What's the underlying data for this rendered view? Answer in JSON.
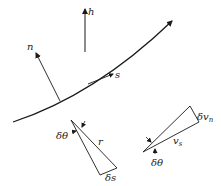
{
  "diagram": {
    "type": "geometry-schematic",
    "colors": {
      "stroke": "#1a1a1a",
      "background": "#ffffff"
    },
    "labels": {
      "h": "h",
      "n": "n",
      "s": "s",
      "triangle1_angle": "δθ",
      "triangle1_radius": "r",
      "triangle1_arc": "δs",
      "triangle2_normal_base": "δv",
      "triangle2_normal_sub": "n",
      "triangle2_side_base": "v",
      "triangle2_side_sub": "s",
      "triangle2_angle": "δθ"
    }
  }
}
